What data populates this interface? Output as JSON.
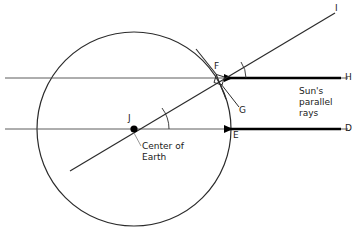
{
  "diagram": {
    "colors": {
      "stroke": "#2b2b2b",
      "ray": "#000000",
      "leader": "#7a7a7a",
      "background": "#ffffff",
      "text": "#1a1a1a"
    },
    "earth": {
      "label": "Center of Earth",
      "center_point_label": "J",
      "cx": 134,
      "cy": 129,
      "r": 97
    },
    "points": [
      {
        "name": "I",
        "label": "I",
        "x": 337,
        "y": 10
      },
      {
        "name": "H",
        "label": "H",
        "x": 348,
        "y": 78
      },
      {
        "name": "D",
        "label": "D",
        "x": 348,
        "y": 129
      },
      {
        "name": "F",
        "label": "F",
        "x": 219,
        "y": 66
      },
      {
        "name": "G",
        "label": "G",
        "x": 240,
        "y": 110
      },
      {
        "name": "E",
        "label": "E",
        "x": 237,
        "y": 139
      },
      {
        "name": "J",
        "label": "J",
        "x": 128,
        "y": 119
      }
    ],
    "annotations": [
      {
        "name": "sun-rays-note",
        "text": "Sun's\nparallel\nrays",
        "lines": [
          "Sun's",
          "parallel",
          "rays"
        ],
        "x": 300,
        "y": 93
      },
      {
        "name": "center-of-earth-note",
        "text": "Center of\nEarth",
        "lines": [
          "Center of",
          "Earth"
        ],
        "x": 143,
        "y": 143
      }
    ],
    "rays": [
      {
        "name": "ray-H",
        "from_label": "H",
        "to_label": "F",
        "y": 78,
        "arrow": "left"
      },
      {
        "name": "ray-D",
        "from_label": "D",
        "to_label": "E",
        "y": 129,
        "arrow": "left"
      }
    ],
    "lines": [
      {
        "name": "upper-parallel-line",
        "x1": 5,
        "y1": 78,
        "x2": 348,
        "y2": 78
      },
      {
        "name": "lower-parallel-line",
        "x1": 5,
        "y1": 129,
        "x2": 348,
        "y2": 129
      },
      {
        "name": "radius-line-JI",
        "x1": 70,
        "y1": 171,
        "x2": 335,
        "y2": 13
      }
    ],
    "marks": {
      "right_angle_at": "F",
      "angle_arc_at_F": true,
      "angle_arc_at_J": true,
      "tangent_at_F": true
    }
  }
}
